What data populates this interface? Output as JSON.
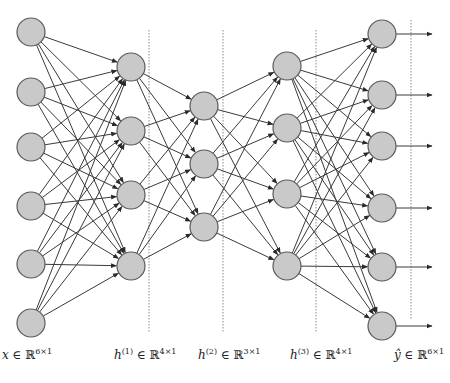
{
  "diagram": {
    "title": "",
    "colors": {
      "node_fill": "#c9c9c9",
      "node_stroke": "#5a5a5a",
      "edge": "#3a3a3a",
      "separator": "#8a8a8a"
    },
    "node_radius": 14,
    "layers": [
      {
        "name": "input",
        "x": 31,
        "ys": [
          32,
          92,
          147,
          206,
          264,
          323
        ]
      },
      {
        "name": "hidden1",
        "x": 131,
        "ys": [
          67,
          131,
          195,
          266
        ]
      },
      {
        "name": "hidden2",
        "x": 204,
        "ys": [
          106,
          164,
          227
        ]
      },
      {
        "name": "hidden3",
        "x": 287,
        "ys": [
          66,
          128,
          194,
          266
        ]
      },
      {
        "name": "output",
        "x": 382,
        "ys": [
          34,
          95,
          146,
          208,
          267,
          326
        ]
      }
    ],
    "separators": [
      {
        "x": 149,
        "y1": 30,
        "y2": 332
      },
      {
        "x": 223,
        "y1": 30,
        "y2": 332
      },
      {
        "x": 316,
        "y1": 30,
        "y2": 332
      },
      {
        "x": 411,
        "y1": 20,
        "y2": 320
      }
    ],
    "output_arrow_end_x": 432,
    "labels": [
      {
        "var": "x",
        "sup": "",
        "set": "∈ ℝ",
        "dim": "6×1",
        "x": 2
      },
      {
        "var": "h",
        "sup": "(1)",
        "set": "∈ ℝ",
        "dim": "4×1",
        "x": 114
      },
      {
        "var": "h",
        "sup": "(2)",
        "set": "∈ ℝ",
        "dim": "3×1",
        "x": 198
      },
      {
        "var": "h",
        "sup": "(3)",
        "set": "∈ ℝ",
        "dim": "4×1",
        "x": 290
      },
      {
        "var": "ŷ",
        "sup": "",
        "set": "∈ ℝ",
        "dim": "6×1",
        "x": 394
      }
    ]
  }
}
